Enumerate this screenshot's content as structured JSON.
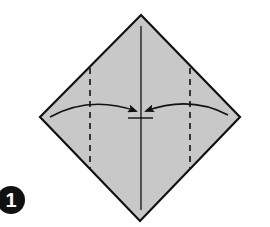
{
  "diagram": {
    "type": "origami-fold-step",
    "step_number": "1",
    "paper_color": "#c8c8c8",
    "line_color": "#111111",
    "shape": "square rotated 45 degrees (diamond)",
    "points": {
      "top": [
        141,
        15
      ],
      "left": [
        40,
        117
      ],
      "right": [
        240,
        117
      ],
      "bottom": [
        140,
        221
      ]
    },
    "center_crease": "vertical line from top to bottom corner",
    "valley_folds": [
      {
        "x": 90,
        "style": "dashed",
        "description": "left fold line"
      },
      {
        "x": 190,
        "style": "dashed",
        "description": "right fold line"
      }
    ],
    "arrows": [
      {
        "from": "left corner",
        "to": "center",
        "description": "fold left corner to center line"
      },
      {
        "from": "right corner",
        "to": "center",
        "description": "fold right corner to center line"
      }
    ],
    "target_mark": "short horizontal line at center below arrows"
  }
}
